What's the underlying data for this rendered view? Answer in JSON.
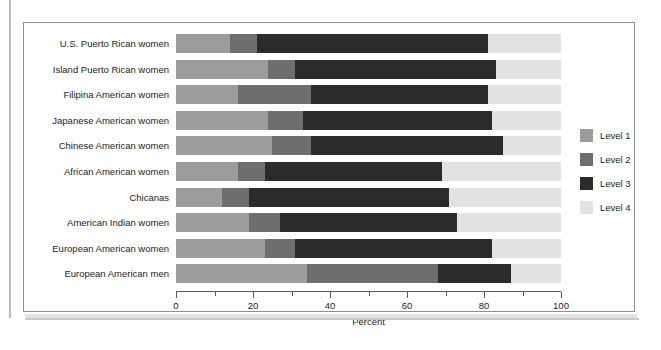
{
  "figure": {
    "faint_top_text": "",
    "axis_title": "Percent"
  },
  "legend": {
    "items": [
      {
        "label": "Level 1",
        "color": "#9c9c9c"
      },
      {
        "label": "Level 2",
        "color": "#6e6e6e"
      },
      {
        "label": "Level 3",
        "color": "#2b2b2b"
      },
      {
        "label": "Level 4",
        "color": "#e2e2e2"
      }
    ]
  },
  "chart_data": {
    "type": "bar",
    "orientation": "horizontal",
    "stacked": true,
    "stack_total": 100,
    "title": "",
    "xlabel": "Percent",
    "ylabel": "",
    "xlim": [
      0,
      100
    ],
    "xticks": [
      0,
      10,
      20,
      30,
      40,
      50,
      60,
      70,
      80,
      90,
      100
    ],
    "xtick_labels": [
      "0",
      "",
      "20",
      "",
      "40",
      "",
      "60",
      "",
      "80",
      "",
      "100"
    ],
    "grid": false,
    "legend_position": "right",
    "categories": [
      "U.S. Puerto Rican women",
      "Island Puerto Rican women",
      "Filipina American women",
      "Japanese American women",
      "Chinese American women",
      "African American women",
      "Chicanas",
      "American Indian women",
      "European American women",
      "European American men"
    ],
    "series": [
      {
        "name": "Level 1",
        "color": "#9c9c9c",
        "values": [
          14,
          24,
          16,
          24,
          25,
          16,
          12,
          19,
          23,
          34
        ]
      },
      {
        "name": "Level 2",
        "color": "#6e6e6e",
        "values": [
          7,
          7,
          19,
          9,
          10,
          7,
          7,
          8,
          8,
          34
        ]
      },
      {
        "name": "Level 3",
        "color": "#2b2b2b",
        "values": [
          60,
          52,
          46,
          49,
          50,
          46,
          52,
          46,
          51,
          19
        ]
      },
      {
        "name": "Level 4",
        "color": "#e2e2e2",
        "values": [
          19,
          17,
          19,
          18,
          15,
          31,
          29,
          27,
          18,
          13
        ]
      }
    ]
  }
}
